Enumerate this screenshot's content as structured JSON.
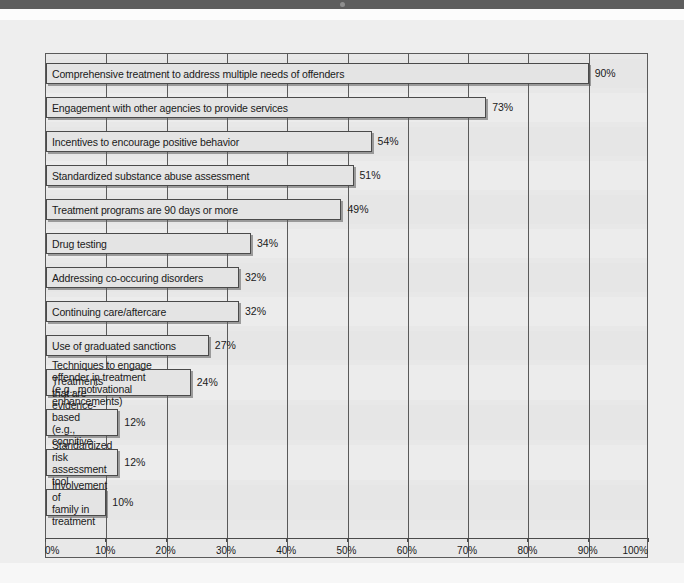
{
  "chart_data": {
    "type": "bar",
    "orientation": "horizontal",
    "title": "",
    "subtitle": "",
    "xlabel": "",
    "ylabel": "",
    "xlim": [
      0,
      100
    ],
    "grid": true,
    "legend": null,
    "value_suffix": "%",
    "tick_labels": [
      "0%",
      "10%",
      "20%",
      "30%",
      "40%",
      "50%",
      "60%",
      "70%",
      "80%",
      "90%",
      "100%"
    ],
    "tick_values": [
      0,
      10,
      20,
      30,
      40,
      50,
      60,
      70,
      80,
      90,
      100
    ],
    "categories": [
      "Comprehensive treatment to address multiple needs of offenders",
      "Engagement with other agencies to provide services",
      "Incentives to encourage positive behavior",
      "Standardized substance abuse assessment",
      "Treatment programs are 90 days or more",
      "Drug testing",
      "Addressing co-occuring disorders",
      "Continuing care/aftercare",
      "Use of graduated sanctions",
      "Techniques to engage offender in treatment\n(e.g., motivational enhancements)",
      "Treatments that are evidence-based\n(e.g., cognitive behavior therapy)",
      "Standardized risk\nassessment tool",
      "Involvement of\nfamily in treatment"
    ],
    "values": [
      90,
      73,
      54,
      51,
      49,
      34,
      32,
      32,
      27,
      24,
      12,
      12,
      10
    ],
    "value_labels": [
      "90%",
      "73%",
      "54%",
      "51%",
      "49%",
      "34%",
      "32%",
      "32%",
      "27%",
      "24%",
      "12%",
      "12%",
      "10%"
    ],
    "colors": {
      "bar_fill": "#e4e4e4",
      "bar_stroke": "#4a4a4a",
      "plot_background": "#e8e8e8",
      "panel_background": "#eeeeee",
      "top_band": "#5e5e5e",
      "text": "#1a1a1a"
    }
  }
}
